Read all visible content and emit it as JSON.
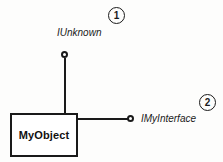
{
  "diagram": {
    "type": "com-interface-lollipop-diagram",
    "background_color": "#fdfdfc",
    "stroke_color": "#1a1a1a",
    "object": {
      "label": "MyObject",
      "shape": "rectangle",
      "fill_color": "#ffffff",
      "border_color": "#1a1a1a"
    },
    "interfaces": [
      {
        "name": "IUnknown",
        "connector": "lollipop",
        "orientation": "vertical-top",
        "callout": "1"
      },
      {
        "name": "IMyInterface",
        "connector": "lollipop",
        "orientation": "horizontal-right",
        "callout": "2"
      }
    ],
    "callouts": [
      {
        "number": "1"
      },
      {
        "number": "2"
      }
    ]
  }
}
